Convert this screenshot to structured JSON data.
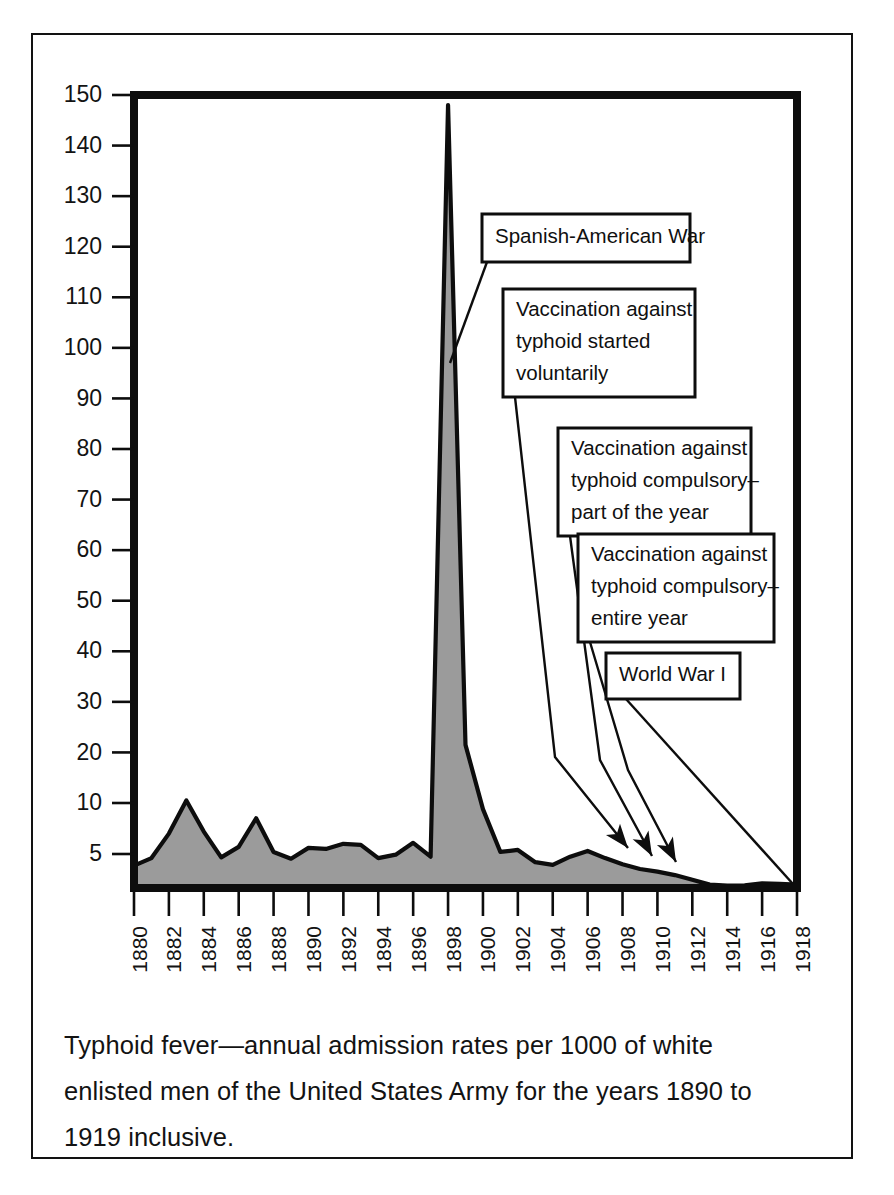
{
  "figure": {
    "caption_line1": "Typhoid fever—annual admission rates per 1000 of white",
    "caption_line2": "enlisted men of the United States Army for the years 1890 to",
    "caption_line3": "1919 inclusive."
  },
  "colors": {
    "area_fill": "#9b9b9b",
    "line": "#0d0d0d",
    "axis": "#0d0d0d",
    "frame": "#121212",
    "background": "#ffffff",
    "text": "#131313"
  },
  "annotations": [
    {
      "id": "spanish-american-war",
      "lines": [
        "Spanish-American War"
      ],
      "target_year": 1898
    },
    {
      "id": "vaccination-voluntary",
      "lines": [
        "Vaccination against",
        "typhoid started",
        "voluntarily"
      ],
      "target_year": 1909
    },
    {
      "id": "vaccination-compulsory-part",
      "lines": [
        "Vaccination against",
        "typhoid compulsory–",
        "part of the year"
      ],
      "target_year": 1910
    },
    {
      "id": "vaccination-compulsory-entire",
      "lines": [
        "Vaccination against",
        "typhoid compulsory–",
        "entire year"
      ],
      "target_year": 1912
    },
    {
      "id": "world-war-i",
      "lines": [
        "World War I"
      ],
      "target_year": 1917
    }
  ],
  "chart_data": {
    "type": "area",
    "title": "Typhoid fever—annual admission rates per 1000 of white enlisted men of the United States Army for the years 1890 to 1919 inclusive.",
    "xlabel": "",
    "ylabel": "",
    "grid": false,
    "legend": "none",
    "xlim": [
      1880,
      1918
    ],
    "ylim": [
      0,
      150
    ],
    "y_ticks": [
      150,
      140,
      130,
      120,
      110,
      100,
      90,
      80,
      70,
      60,
      50,
      40,
      30,
      20,
      10,
      5
    ],
    "y_scale_note": "Linear from 10 to 150; expanded spacing below 10 where only 5 is labelled",
    "x_ticks": [
      1880,
      1882,
      1884,
      1886,
      1888,
      1890,
      1892,
      1894,
      1896,
      1898,
      1900,
      1902,
      1904,
      1906,
      1908,
      1910,
      1912,
      1914,
      1916,
      1918
    ],
    "x": [
      1880,
      1881,
      1882,
      1883,
      1884,
      1885,
      1886,
      1887,
      1888,
      1889,
      1890,
      1891,
      1892,
      1893,
      1894,
      1895,
      1896,
      1897,
      1898,
      1899,
      1900,
      1901,
      1902,
      1903,
      1904,
      1905,
      1906,
      1907,
      1908,
      1909,
      1910,
      1911,
      1912,
      1913,
      1914,
      1915,
      1916,
      1917,
      1918
    ],
    "values": [
      3.3,
      4.4,
      7.0,
      10.5,
      7.2,
      4.5,
      5.7,
      8.5,
      5.2,
      4.3,
      5.6,
      5.5,
      6.0,
      5.9,
      4.4,
      4.9,
      6.1,
      4.6,
      148.0,
      21.5,
      9.4,
      5.2,
      5.4,
      3.8,
      3.4,
      4.6,
      5.3,
      4.4,
      3.5,
      2.8,
      2.4,
      1.9,
      1.2,
      0.5,
      0.35,
      0.4,
      0.7,
      0.6,
      0.5
    ]
  }
}
